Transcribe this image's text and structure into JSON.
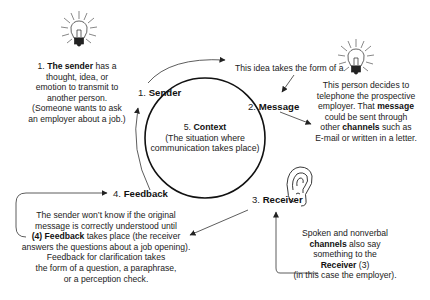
{
  "diagram": {
    "type": "communication-process-cycle",
    "stages": [
      {
        "number": "1.",
        "name": "Sender"
      },
      {
        "number": "2.",
        "name": "Message"
      },
      {
        "number": "3.",
        "name": "Receiver"
      },
      {
        "number": "4.",
        "name": "Feedback"
      },
      {
        "number": "5.",
        "name": "Context"
      }
    ],
    "context": {
      "number": "5.",
      "name": "Context",
      "description": "(The situation where communication takes place)",
      "line1": "(The situation where",
      "line2": "communication takes place)"
    },
    "sender_note": {
      "l1_prefix": "1. ",
      "l1_bold": "The sender",
      "l1_suffix": " has a",
      "l2": "thought, idea, or",
      "l3": "emotion to transmit to",
      "l4": "another person.",
      "l5": "(Someone wants to ask",
      "l6": "an employer about a job.)"
    },
    "message_intro": "This idea takes the form of a",
    "message_note": {
      "l1": "This person decides to",
      "l2": "telephone the prospective",
      "l3_prefix": "employer. That ",
      "l3_bold": "message",
      "l4": "could be sent through",
      "l5_prefix": "other ",
      "l5_bold": "channels",
      "l5_suffix": " such as",
      "l6": "E-mail or written in a letter."
    },
    "receiver_note": {
      "l1": "Spoken and nonverbal",
      "l2_bold": "channels",
      "l2_suffix": " also say",
      "l3": "something to the",
      "l4_bold": "Receiver",
      "l4_suffix": " (3)",
      "l5": "(in this case the employer)."
    },
    "feedback_note": {
      "l1": "The sender won’t know if the original",
      "l2": "message is correctly understood until",
      "l3_bold": "(4) Feedback",
      "l3_suffix": " takes place (the receiver",
      "l4": "answers the questions about a job opening).",
      "l5": "Feedback for clarification takes",
      "l6": "the form of a question, a paraphrase,",
      "l7": "or a perception check."
    },
    "icons": [
      "lightbulb-icon",
      "lightbulb-icon",
      "ear-icon"
    ]
  }
}
